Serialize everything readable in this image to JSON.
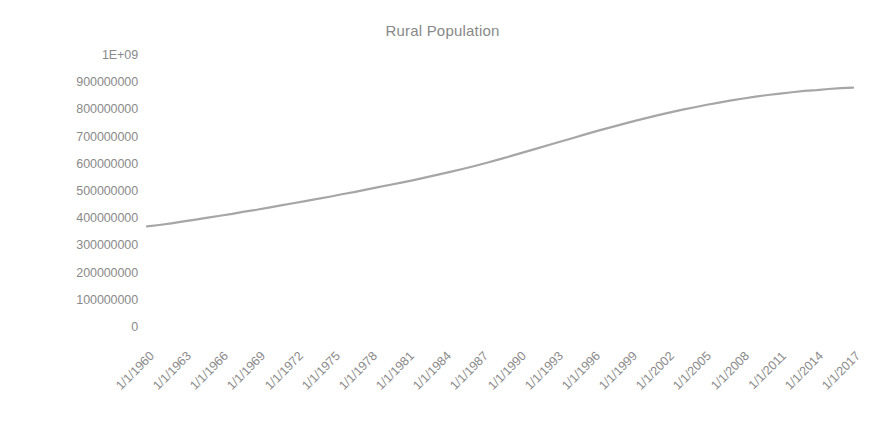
{
  "chart_data": {
    "type": "line",
    "title": "Rural Population",
    "xlabel": "",
    "ylabel": "",
    "grid": false,
    "legend": false,
    "legend_position": "none",
    "ylim": [
      0,
      1000000000
    ],
    "ytick_labels": [
      "1E+09",
      "900000000",
      "800000000",
      "700000000",
      "600000000",
      "500000000",
      "400000000",
      "300000000",
      "200000000",
      "100000000",
      "0"
    ],
    "ytick_values": [
      1000000000,
      900000000,
      800000000,
      700000000,
      600000000,
      500000000,
      400000000,
      300000000,
      200000000,
      100000000,
      0
    ],
    "xtick_labels": [
      "1/1/1960",
      "1/1/1963",
      "1/1/1966",
      "1/1/1969",
      "1/1/1972",
      "1/1/1975",
      "1/1/1978",
      "1/1/1981",
      "1/1/1984",
      "1/1/1987",
      "1/1/1990",
      "1/1/1993",
      "1/1/1996",
      "1/1/1999",
      "1/1/2002",
      "1/1/2005",
      "1/1/2008",
      "1/1/2011",
      "1/1/2014",
      "1/1/2017"
    ],
    "series": [
      {
        "name": "Rural Population",
        "color": "#a6a6a6",
        "x": [
          "1/1/1960",
          "1/1/1961",
          "1/1/1962",
          "1/1/1963",
          "1/1/1964",
          "1/1/1965",
          "1/1/1966",
          "1/1/1967",
          "1/1/1968",
          "1/1/1969",
          "1/1/1970",
          "1/1/1971",
          "1/1/1972",
          "1/1/1973",
          "1/1/1974",
          "1/1/1975",
          "1/1/1976",
          "1/1/1977",
          "1/1/1978",
          "1/1/1979",
          "1/1/1980",
          "1/1/1981",
          "1/1/1982",
          "1/1/1983",
          "1/1/1984",
          "1/1/1985",
          "1/1/1986",
          "1/1/1987",
          "1/1/1988",
          "1/1/1989",
          "1/1/1990",
          "1/1/1991",
          "1/1/1992",
          "1/1/1993",
          "1/1/1994",
          "1/1/1995",
          "1/1/1996",
          "1/1/1997",
          "1/1/1998",
          "1/1/1999",
          "1/1/2000",
          "1/1/2001",
          "1/1/2002",
          "1/1/2003",
          "1/1/2004",
          "1/1/2005",
          "1/1/2006",
          "1/1/2007",
          "1/1/2008",
          "1/1/2009",
          "1/1/2010",
          "1/1/2011",
          "1/1/2012",
          "1/1/2013",
          "1/1/2014",
          "1/1/2015",
          "1/1/2016",
          "1/1/2017",
          "1/1/2018"
        ],
        "values": [
          370000000,
          375000000,
          381000000,
          388000000,
          395000000,
          402000000,
          409000000,
          416000000,
          424000000,
          431000000,
          439000000,
          447000000,
          455000000,
          463000000,
          471000000,
          479000000,
          488000000,
          496000000,
          505000000,
          514000000,
          523000000,
          532000000,
          541000000,
          551000000,
          561000000,
          571000000,
          582000000,
          593000000,
          605000000,
          617000000,
          630000000,
          643000000,
          656000000,
          669000000,
          682000000,
          695000000,
          708000000,
          721000000,
          733000000,
          745000000,
          757000000,
          768000000,
          779000000,
          789000000,
          799000000,
          808000000,
          817000000,
          825000000,
          833000000,
          840000000,
          847000000,
          853000000,
          858000000,
          863000000,
          868000000,
          871000000,
          875000000,
          878000000,
          880000000
        ]
      }
    ],
    "annotations": []
  },
  "axis_style": {
    "tick_label_color": "#8a8a8a",
    "title_color": "#888888",
    "background": "#ffffff",
    "line_color": "#a6a6a6"
  }
}
